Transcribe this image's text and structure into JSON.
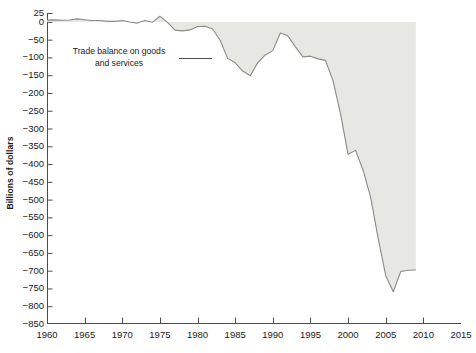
{
  "chart_data": {
    "type": "area",
    "title": "",
    "xlabel": "",
    "ylabel": "Billions of dollars",
    "xlim": [
      1960,
      2015
    ],
    "ylim": [
      -850,
      25
    ],
    "yticks": [
      25,
      0,
      -50,
      -100,
      -150,
      -200,
      -250,
      -300,
      -350,
      -400,
      -450,
      -500,
      -550,
      -600,
      -650,
      -700,
      -750,
      -800,
      -850
    ],
    "ytick_labels": [
      "25",
      "0",
      "−50",
      "−100",
      "−150",
      "−200",
      "−250",
      "−300",
      "−350",
      "−400",
      "−450",
      "−500",
      "−550",
      "−600",
      "−650",
      "−700",
      "−750",
      "−800",
      "−850"
    ],
    "xticks": [
      1960,
      1965,
      1970,
      1975,
      1980,
      1985,
      1990,
      1995,
      2000,
      2005,
      2010,
      2015
    ],
    "xtick_labels": [
      "1960",
      "1965",
      "1970",
      "1975",
      "1980",
      "1985",
      "1990",
      "1995",
      "2000",
      "2005",
      "2010",
      "2015"
    ],
    "grid": false,
    "legend": "none",
    "fill_color": "#e7e7e4",
    "line_color": "#8a8a86",
    "axis_color": "#4d4d4d",
    "annotations": [
      {
        "text_line1": "Trade balance on goods",
        "text_line2": "and services",
        "leader_from_x": 179,
        "leader_to_x": 212,
        "leader_y": 58
      }
    ],
    "series": [
      {
        "name": "Trade balance on goods and services",
        "x": [
          1960,
          1961,
          1962,
          1963,
          1964,
          1965,
          1966,
          1967,
          1968,
          1969,
          1970,
          1971,
          1972,
          1973,
          1974,
          1975,
          1976,
          1977,
          1978,
          1979,
          1980,
          1981,
          1982,
          1983,
          1984,
          1985,
          1986,
          1987,
          1988,
          1989,
          1990,
          1991,
          1992,
          1993,
          1994,
          1995,
          1996,
          1997,
          1998,
          1999,
          2000,
          2001,
          2002,
          2003,
          2004,
          2005,
          2006,
          2007,
          2008,
          2009
        ],
        "y": [
          4.9,
          5.6,
          4.5,
          5.2,
          8.5,
          6.2,
          3.9,
          3.8,
          1.4,
          1.4,
          4.0,
          -0.3,
          -3.4,
          4.0,
          -0.8,
          16.0,
          -1.6,
          -23.1,
          -25.4,
          -22.5,
          -13.1,
          -12.5,
          -20.0,
          -51.6,
          -102.7,
          -115.2,
          -138.3,
          -151.7,
          -114.6,
          -93.1,
          -80.9,
          -31.1,
          -39.2,
          -70.3,
          -98.5,
          -96.4,
          -104.1,
          -108.3,
          -166.1,
          -258.6,
          -372.5,
          -361.5,
          -418.0,
          -493.9,
          -609.9,
          -714.2,
          -759.3,
          -702.3,
          -698.8,
          -698.0
        ],
        "units": "Billions of dollars"
      }
    ],
    "key_points": [
      {
        "year": 1975,
        "value": 16.0,
        "note": "local surplus peak"
      },
      {
        "year": 1987,
        "value": -151.7,
        "note": "mid-1980s trough"
      },
      {
        "year": 1991,
        "value": -31.1,
        "note": "early-1990s improvement"
      },
      {
        "year": 2001,
        "value": -361.5,
        "note": "recession notch"
      },
      {
        "year": 2006,
        "value": -759.3,
        "note": "record deficit"
      },
      {
        "year": 2009,
        "value": -698.0,
        "note": "series end"
      }
    ]
  }
}
